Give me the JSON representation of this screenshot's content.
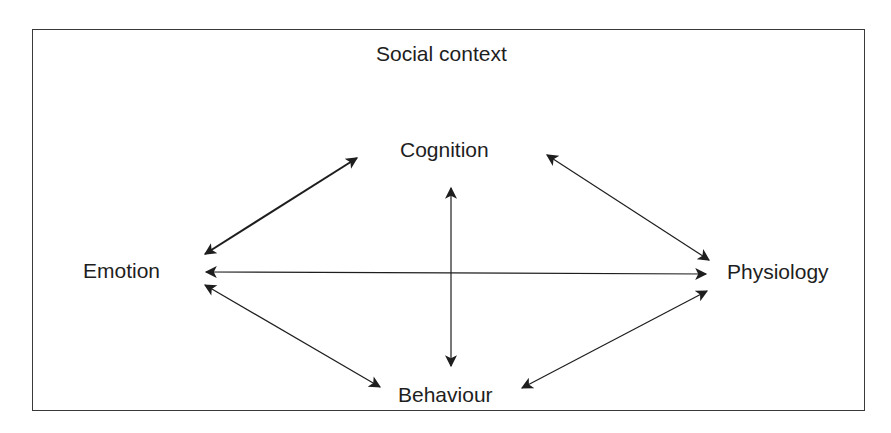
{
  "diagram": {
    "container_label": "Social context",
    "nodes": [
      {
        "id": "cognition",
        "label": "Cognition"
      },
      {
        "id": "emotion",
        "label": "Emotion"
      },
      {
        "id": "physiology",
        "label": "Physiology"
      },
      {
        "id": "behaviour",
        "label": "Behaviour"
      }
    ],
    "edges": [
      {
        "from": "emotion",
        "to": "cognition",
        "type": "bidirectional"
      },
      {
        "from": "cognition",
        "to": "physiology",
        "type": "bidirectional"
      },
      {
        "from": "emotion",
        "to": "physiology",
        "type": "bidirectional"
      },
      {
        "from": "cognition",
        "to": "behaviour",
        "type": "bidirectional"
      },
      {
        "from": "emotion",
        "to": "behaviour",
        "type": "bidirectional"
      },
      {
        "from": "behaviour",
        "to": "physiology",
        "type": "bidirectional"
      }
    ],
    "colors": {
      "line": "#1e1e1e",
      "frame": "#3a3a3a",
      "background": "#ffffff"
    }
  }
}
